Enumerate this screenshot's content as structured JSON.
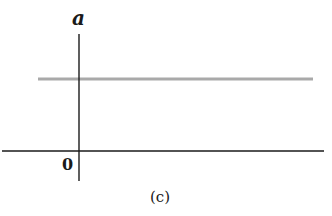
{
  "figure": {
    "y_axis_label": "a",
    "origin_label": "0",
    "caption": "(c)",
    "colors": {
      "axes": "#1a1a1a",
      "series_line": "#a9a9a9",
      "background": "#ffffff"
    }
  },
  "plot": {
    "description": "Acceleration vs time: constant positive acceleration shown as a horizontal line above the time axis",
    "series": [
      {
        "name": "a(t)",
        "shape": "horizontal-constant",
        "relative_level": "positive"
      }
    ]
  }
}
